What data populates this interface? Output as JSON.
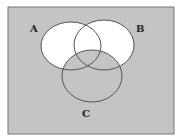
{
  "diagram": {
    "type": "venn",
    "universe": {
      "x": 8,
      "y": 7,
      "width": 166,
      "height": 127,
      "fill": "#c4c4c4"
    },
    "sets": [
      {
        "label": "A",
        "cx": 71,
        "cy": 46,
        "rx": 30,
        "ry": 24,
        "label_x": 30,
        "label_y": 32
      },
      {
        "label": "B",
        "cx": 104,
        "cy": 45,
        "rx": 30,
        "ry": 25,
        "label_x": 136,
        "label_y": 32
      },
      {
        "label": "C",
        "cx": 92,
        "cy": 76,
        "rx": 30,
        "ry": 26,
        "label_x": 82,
        "label_y": 117
      }
    ],
    "shaded_white": "(A ∪ B) − C",
    "shaded_gray": "(A ∪ B)ᶜ ∪ C",
    "colors": {
      "white": "#ffffff",
      "gray": "#c4c4c4",
      "stroke": "#555555"
    }
  }
}
